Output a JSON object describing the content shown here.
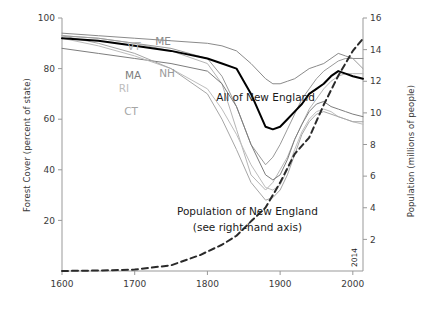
{
  "chart_data": {
    "type": "line",
    "title": "",
    "xlabel": "",
    "ylabel": "Forest Cover (percent of state)",
    "y2label": "Population (millions of people)",
    "xlim": [
      1600,
      2014
    ],
    "ylim": [
      0,
      100
    ],
    "y2lim": [
      0,
      16
    ],
    "grid": false,
    "legend": "inline-labels",
    "xticks": [
      1600,
      1700,
      1800,
      1900,
      2000
    ],
    "xticklabels": [
      "1600",
      "1700",
      "1800",
      "1900",
      "2000"
    ],
    "yticks": [
      20,
      40,
      60,
      80,
      100
    ],
    "yticklabels": [
      "20",
      "40",
      "60",
      "80",
      "100"
    ],
    "y2ticks": [
      2,
      4,
      6,
      8,
      10,
      12,
      14,
      16
    ],
    "y2ticklabels": [
      "2",
      "4",
      "6",
      "8",
      "10",
      "12",
      "14",
      "16"
    ],
    "end_year_label": "2014",
    "annotations": [
      {
        "text": "All of New England",
        "x": 1880,
        "y": 67
      },
      {
        "text": "Population of New England",
        "x": 1855,
        "y": 22
      },
      {
        "text": "(see right-hand axis)",
        "x": 1855,
        "y": 16
      }
    ],
    "series": [
      {
        "name": "ME",
        "label": "ME",
        "color": "#8a8a8a",
        "axis": "left",
        "style": "solid",
        "x": [
          1600,
          1650,
          1700,
          1750,
          1800,
          1820,
          1840,
          1860,
          1880,
          1890,
          1900,
          1910,
          1920,
          1930,
          1940,
          1950,
          1960,
          1970,
          1980,
          1990,
          2000,
          2014
        ],
        "values": [
          94,
          93,
          92,
          91,
          90,
          89,
          87,
          82,
          76,
          74,
          74,
          75,
          76,
          78,
          80,
          81,
          82,
          84,
          86,
          85,
          84,
          84
        ]
      },
      {
        "name": "VT",
        "label": "VT",
        "color": "#b5b5b5",
        "axis": "left",
        "style": "solid",
        "x": [
          1600,
          1650,
          1700,
          1750,
          1800,
          1820,
          1840,
          1860,
          1880,
          1890,
          1900,
          1910,
          1920,
          1930,
          1940,
          1950,
          1960,
          1970,
          1980,
          1990,
          2000,
          2014
        ],
        "values": [
          93,
          92,
          90,
          87,
          82,
          74,
          56,
          38,
          32,
          35,
          40,
          45,
          52,
          58,
          64,
          68,
          72,
          75,
          77,
          78,
          78,
          78
        ]
      },
      {
        "name": "NH",
        "label": "NH",
        "color": "#9a9a9a",
        "axis": "left",
        "style": "solid",
        "x": [
          1600,
          1650,
          1700,
          1750,
          1800,
          1820,
          1840,
          1860,
          1880,
          1890,
          1900,
          1910,
          1920,
          1930,
          1940,
          1950,
          1960,
          1970,
          1980,
          1990,
          2000,
          2014
        ],
        "values": [
          93,
          92,
          90,
          88,
          84,
          77,
          65,
          50,
          42,
          45,
          50,
          56,
          62,
          68,
          72,
          76,
          79,
          81,
          83,
          84,
          84,
          80
        ]
      },
      {
        "name": "MA",
        "label": "MA",
        "color": "#7d7d7d",
        "axis": "left",
        "style": "solid",
        "x": [
          1600,
          1650,
          1700,
          1750,
          1800,
          1820,
          1840,
          1860,
          1880,
          1890,
          1900,
          1910,
          1920,
          1930,
          1940,
          1950,
          1960,
          1970,
          1980,
          1990,
          2000,
          2014
        ],
        "values": [
          88,
          86,
          84,
          82,
          79,
          74,
          65,
          50,
          38,
          36,
          38,
          44,
          52,
          58,
          63,
          66,
          67,
          65,
          64,
          63,
          62,
          61
        ]
      },
      {
        "name": "RI",
        "label": "RI",
        "color": "#bdbdbd",
        "axis": "left",
        "style": "solid",
        "x": [
          1600,
          1650,
          1700,
          1750,
          1800,
          1820,
          1840,
          1860,
          1880,
          1890,
          1900,
          1910,
          1920,
          1930,
          1940,
          1950,
          1960,
          1970,
          1980,
          1990,
          2000,
          2014
        ],
        "values": [
          92,
          89,
          85,
          80,
          72,
          64,
          54,
          42,
          33,
          32,
          34,
          40,
          48,
          55,
          60,
          63,
          64,
          63,
          61,
          60,
          59,
          58
        ]
      },
      {
        "name": "CT",
        "label": "CT",
        "color": "#a6a6a6",
        "axis": "left",
        "style": "solid",
        "x": [
          1600,
          1650,
          1700,
          1750,
          1800,
          1820,
          1840,
          1860,
          1880,
          1890,
          1900,
          1910,
          1920,
          1930,
          1940,
          1950,
          1960,
          1970,
          1980,
          1990,
          2000,
          2014
        ],
        "values": [
          93,
          90,
          86,
          80,
          70,
          60,
          48,
          35,
          28,
          29,
          32,
          38,
          46,
          54,
          59,
          62,
          63,
          62,
          61,
          60,
          59,
          59
        ]
      },
      {
        "name": "All of New England",
        "label": "All of New England",
        "color": "#000000",
        "axis": "left",
        "style": "solid",
        "x": [
          1600,
          1650,
          1700,
          1750,
          1800,
          1820,
          1840,
          1860,
          1880,
          1890,
          1900,
          1910,
          1920,
          1930,
          1940,
          1950,
          1960,
          1970,
          1980,
          1990,
          2000,
          2014
        ],
        "values": [
          92,
          91,
          89,
          87,
          84,
          82,
          80,
          70,
          57,
          56,
          57,
          60,
          63,
          66,
          70,
          72,
          74,
          77,
          79,
          78,
          77,
          76
        ]
      },
      {
        "name": "Population of New England",
        "label": "Population of New England",
        "color": "#2a2a2a",
        "axis": "right",
        "style": "dashed",
        "x": [
          1600,
          1650,
          1700,
          1750,
          1790,
          1800,
          1820,
          1840,
          1860,
          1880,
          1900,
          1920,
          1940,
          1960,
          1980,
          2000,
          2014
        ],
        "values": [
          0.0,
          0.03,
          0.09,
          0.36,
          1.01,
          1.23,
          1.66,
          2.23,
          3.14,
          4.01,
          5.59,
          7.4,
          8.44,
          10.51,
          12.35,
          13.92,
          14.7
        ]
      }
    ]
  }
}
